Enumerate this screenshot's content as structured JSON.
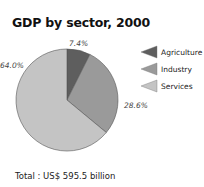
{
  "chart_data": {
    "type": "pie",
    "title": "GDP by sector, 2000",
    "categories": [
      "Agriculture",
      "Industry",
      "Services"
    ],
    "values": [
      7.4,
      28.6,
      64.0
    ],
    "labels": [
      "7.4%",
      "28.6%",
      "64.0%"
    ],
    "colors": [
      "#5e5e5e",
      "#9a9a9a",
      "#c4c4c4"
    ],
    "legend": "right",
    "footer": "Total : US$ 595.5 billion",
    "total": "US$ 595.5 billion"
  }
}
